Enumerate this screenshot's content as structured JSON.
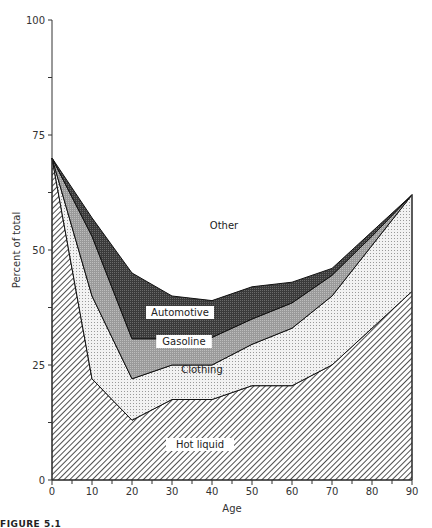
{
  "chart_data": {
    "type": "area",
    "stacked": true,
    "title": "",
    "xlabel": "Age",
    "ylabel": "Percent of total",
    "xlim": [
      0,
      90
    ],
    "ylim": [
      0,
      100
    ],
    "x_ticks": [
      0,
      10,
      20,
      30,
      40,
      50,
      60,
      70,
      80,
      90
    ],
    "y_ticks": [
      0,
      25,
      50,
      75,
      100
    ],
    "x": [
      0,
      10,
      20,
      30,
      40,
      50,
      60,
      70,
      80,
      90
    ],
    "series": [
      {
        "name": "Hot liquid",
        "values": [
          70,
          22,
          13,
          17.5,
          17.5,
          20.5,
          20.5,
          25,
          33,
          41
        ]
      },
      {
        "name": "Clothing",
        "values": [
          0,
          18,
          9,
          7.5,
          7.5,
          9,
          12.5,
          15,
          18,
          21
        ]
      },
      {
        "name": "Gasoline",
        "values": [
          0,
          13,
          8.7,
          5.7,
          6,
          5.5,
          5.5,
          4.5,
          2,
          0
        ]
      },
      {
        "name": "Automotive",
        "values": [
          0,
          4,
          14.3,
          9.3,
          8,
          7,
          4.5,
          1.5,
          1,
          0
        ]
      },
      {
        "name": "Other",
        "values": [
          30,
          43,
          55,
          60,
          61,
          58,
          57,
          54,
          46,
          38
        ]
      }
    ],
    "annotations": [
      "Other",
      "Automotive",
      "Gasoline",
      "Clothing",
      "Hot liquid"
    ],
    "grid": false,
    "legend": "inline labels"
  },
  "caption": "FIGURE 5.1"
}
